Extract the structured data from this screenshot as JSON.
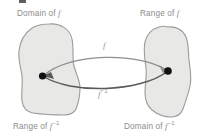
{
  "figure": {
    "title_labels": {
      "top_left": {
        "text": "Domain of ",
        "symbol": "f"
      },
      "top_right": {
        "text": "Range of ",
        "symbol": "f"
      },
      "bottom_left": {
        "text": "Range of ",
        "symbol": "f",
        "exponent": "−1"
      },
      "bottom_right": {
        "text": "Domain of ",
        "symbol": "f",
        "exponent": "−1"
      }
    },
    "mapping_labels": {
      "forward": {
        "symbol": "f"
      },
      "inverse": {
        "symbol": "f",
        "exponent": "−1"
      }
    },
    "sets": [
      {
        "name": "left-set",
        "role": "Domain of f / Range of f inverse"
      },
      {
        "name": "right-set",
        "role": "Range of f / Domain of f inverse"
      }
    ],
    "points": [
      {
        "name": "left-point",
        "set": "left-set"
      },
      {
        "name": "right-point",
        "set": "right-set"
      }
    ],
    "arrows": [
      {
        "name": "forward-arrow",
        "from": "left-point",
        "to": "right-point",
        "label": "f"
      },
      {
        "name": "inverse-arrow",
        "from": "right-point",
        "to": "left-point",
        "label": "f−1"
      }
    ],
    "colors": {
      "background": "#ffffff",
      "set_fill": "#e8e8e6",
      "set_stroke": "#9b9b99",
      "point": "#111111",
      "arrow_forward": "#8f8f8f",
      "arrow_inverse": "#5a5a5a",
      "label_text": "#8c8c8c"
    }
  }
}
